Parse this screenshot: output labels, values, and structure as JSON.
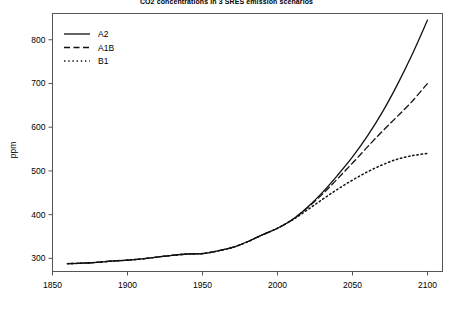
{
  "chart_data": {
    "type": "line",
    "title": "CO2 concentrations in 3 SRES emission scenarios",
    "xlabel": "",
    "ylabel": "ppm",
    "xlim": [
      1850,
      2110
    ],
    "ylim": [
      270,
      860
    ],
    "xticks": [
      1850,
      1900,
      1950,
      2000,
      2050,
      2100
    ],
    "xtick_labels": [
      "1850",
      "1900",
      "1950",
      "2000",
      "2050",
      "2100"
    ],
    "yticks": [
      300,
      400,
      500,
      600,
      700,
      800
    ],
    "ytick_labels": [
      "300",
      "400",
      "500",
      "600",
      "700",
      "800"
    ],
    "grid": false,
    "legend_position": "top-left",
    "series": [
      {
        "name": "A2",
        "style": "solid",
        "color": "#111111",
        "x": [
          1860,
          1870,
          1880,
          1890,
          1900,
          1910,
          1920,
          1930,
          1940,
          1950,
          1960,
          1970,
          1980,
          1990,
          2000,
          2010,
          2020,
          2030,
          2040,
          2050,
          2060,
          2070,
          2080,
          2090,
          2100
        ],
        "y": [
          288,
          289,
          291,
          294,
          296,
          299,
          303,
          307,
          310,
          311,
          317,
          325,
          338,
          354,
          369,
          389,
          417,
          451,
          490,
          532,
          580,
          635,
          698,
          768,
          845
        ]
      },
      {
        "name": "A1B",
        "style": "dashed",
        "color": "#111111",
        "x": [
          1860,
          1870,
          1880,
          1890,
          1900,
          1910,
          1920,
          1930,
          1940,
          1950,
          1960,
          1970,
          1980,
          1990,
          2000,
          2010,
          2020,
          2030,
          2040,
          2050,
          2060,
          2070,
          2080,
          2090,
          2100
        ],
        "y": [
          288,
          289,
          291,
          294,
          296,
          299,
          303,
          307,
          310,
          311,
          317,
          325,
          338,
          354,
          369,
          389,
          416,
          447,
          482,
          518,
          555,
          591,
          625,
          660,
          700
        ]
      },
      {
        "name": "B1",
        "style": "dotted",
        "color": "#111111",
        "x": [
          1860,
          1870,
          1880,
          1890,
          1900,
          1910,
          1920,
          1930,
          1940,
          1950,
          1960,
          1970,
          1980,
          1990,
          2000,
          2010,
          2020,
          2030,
          2040,
          2050,
          2060,
          2070,
          2080,
          2090,
          2100
        ],
        "y": [
          288,
          289,
          291,
          294,
          296,
          299,
          303,
          307,
          310,
          311,
          317,
          325,
          338,
          354,
          369,
          388,
          411,
          435,
          458,
          479,
          498,
          514,
          527,
          535,
          540
        ]
      }
    ]
  },
  "legend": {
    "entries": [
      {
        "label": "A2"
      },
      {
        "label": "A1B"
      },
      {
        "label": "B1"
      }
    ]
  }
}
